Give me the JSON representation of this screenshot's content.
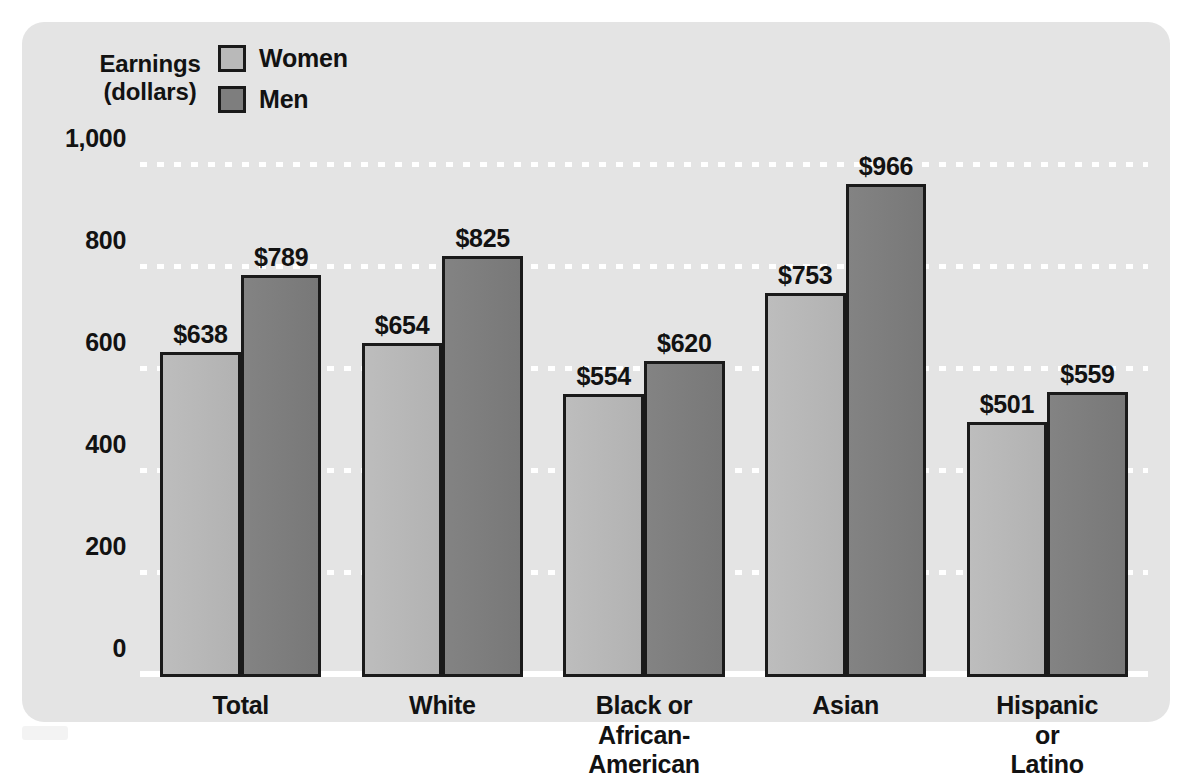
{
  "axis_title": "Earnings\n(dollars)",
  "legend": {
    "items": [
      {
        "label": "Women",
        "color": "#b9b9b9",
        "key": "women"
      },
      {
        "label": "Men",
        "color": "#7e7e7e",
        "key": "men"
      }
    ]
  },
  "chart_data": {
    "type": "bar",
    "title": "",
    "xlabel": "",
    "ylabel": "Earnings (dollars)",
    "ylim": [
      0,
      1000
    ],
    "ytick_labels": [
      "0",
      "200",
      "400",
      "600",
      "800",
      "1,000"
    ],
    "yticks": [
      0,
      200,
      400,
      600,
      800,
      1000
    ],
    "grid": true,
    "grid_style": "white dotted horizontal",
    "legend_position": "top-left",
    "categories": [
      "Total",
      "White",
      "Black or\nAfrican-American",
      "Asian",
      "Hispanic or Latino"
    ],
    "series": [
      {
        "name": "Women",
        "color": "#b9b9b9",
        "values": [
          638,
          654,
          554,
          753,
          501
        ]
      },
      {
        "name": "Men",
        "color": "#7e7e7e",
        "values": [
          789,
          825,
          620,
          966,
          559
        ]
      }
    ],
    "value_labels": [
      [
        "$638",
        "$789"
      ],
      [
        "$654",
        "$825"
      ],
      [
        "$554",
        "$620"
      ],
      [
        "$753",
        "$966"
      ],
      [
        "$501",
        "$559"
      ]
    ]
  },
  "colors": {
    "panel_background": "#e4e4e4",
    "page_background": "#ffffff",
    "bar_outline": "#1a1a1a",
    "gridline": "#ffffff",
    "text": "#121212"
  }
}
